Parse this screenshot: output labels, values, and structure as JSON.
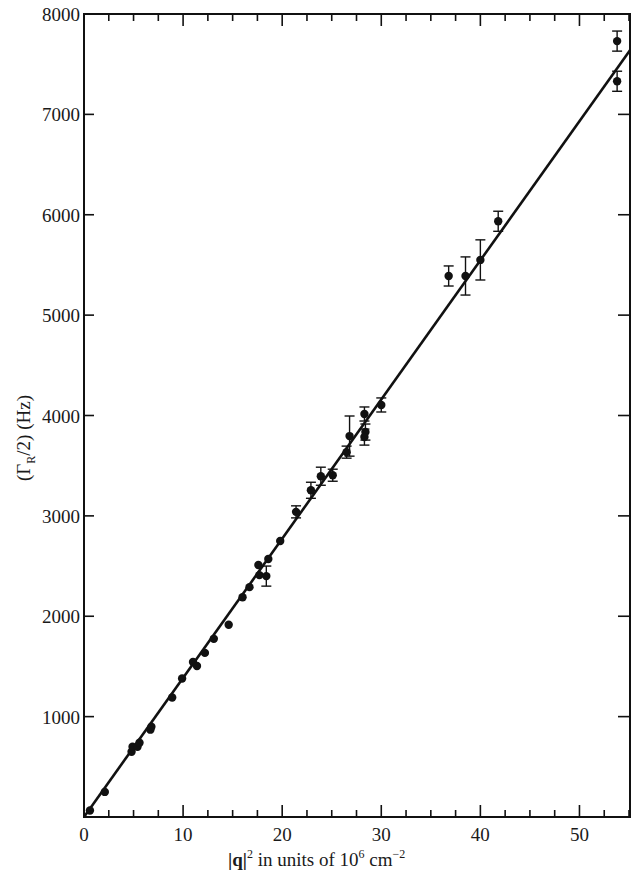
{
  "chart_data": {
    "type": "scatter",
    "title": "",
    "xlabel": "|q|² in units of 10⁶ cm⁻²",
    "xlabel_parts": {
      "q": "|q|",
      "sup1": "2",
      "mid": " in units of 10",
      "sup2": "6",
      "end": " cm",
      "sup3": "−2"
    },
    "ylabel": "(ΓR/2) (Hz)",
    "ylabel_parts": {
      "open": "(Γ",
      "sub": "R",
      "close": "/2) (Hz)"
    },
    "xlim": [
      0,
      55.1
    ],
    "ylim": [
      0,
      8000
    ],
    "x_major_ticks": [
      0,
      10,
      20,
      30,
      40,
      50
    ],
    "x_tick_labels": [
      "0",
      "10",
      "20",
      "30",
      "40",
      "50"
    ],
    "x_minor_step": 2.5,
    "y_major_ticks": [
      1000,
      2000,
      3000,
      4000,
      5000,
      6000,
      7000,
      8000
    ],
    "y_tick_labels": [
      "1000",
      "2000",
      "3000",
      "4000",
      "5000",
      "6000",
      "7000",
      "8000"
    ],
    "grid": false,
    "legend": null,
    "series": [
      {
        "name": "measurements",
        "marker": "filled-circle",
        "points": [
          {
            "x": 0.6,
            "y": 65,
            "err": 0
          },
          {
            "x": 2.1,
            "y": 250,
            "err": 0
          },
          {
            "x": 4.8,
            "y": 650,
            "err": 0
          },
          {
            "x": 4.9,
            "y": 700,
            "err": 0
          },
          {
            "x": 5.4,
            "y": 700,
            "err": 0
          },
          {
            "x": 5.6,
            "y": 740,
            "err": 0
          },
          {
            "x": 6.7,
            "y": 870,
            "err": 0
          },
          {
            "x": 6.8,
            "y": 900,
            "err": 0
          },
          {
            "x": 8.9,
            "y": 1190,
            "err": 0
          },
          {
            "x": 9.9,
            "y": 1380,
            "err": 0
          },
          {
            "x": 11.0,
            "y": 1545,
            "err": 0
          },
          {
            "x": 11.4,
            "y": 1505,
            "err": 0
          },
          {
            "x": 12.2,
            "y": 1635,
            "err": 0
          },
          {
            "x": 13.1,
            "y": 1775,
            "err": 0
          },
          {
            "x": 14.6,
            "y": 1915,
            "err": 0
          },
          {
            "x": 16.0,
            "y": 2190,
            "err": 0
          },
          {
            "x": 16.7,
            "y": 2290,
            "err": 0
          },
          {
            "x": 17.6,
            "y": 2510,
            "err": 0
          },
          {
            "x": 17.7,
            "y": 2410,
            "err": 0
          },
          {
            "x": 18.4,
            "y": 2400,
            "err": 100
          },
          {
            "x": 18.6,
            "y": 2570,
            "err": 0
          },
          {
            "x": 19.8,
            "y": 2750,
            "err": 0
          },
          {
            "x": 21.4,
            "y": 3040,
            "err": 60
          },
          {
            "x": 22.9,
            "y": 3255,
            "err": 80
          },
          {
            "x": 23.9,
            "y": 3395,
            "err": 90
          },
          {
            "x": 25.1,
            "y": 3405,
            "err": 60
          },
          {
            "x": 26.5,
            "y": 3635,
            "err": 60
          },
          {
            "x": 26.8,
            "y": 3795,
            "err": 200
          },
          {
            "x": 28.3,
            "y": 4015,
            "err": 70
          },
          {
            "x": 28.4,
            "y": 3835,
            "err": 80
          },
          {
            "x": 28.3,
            "y": 3785,
            "err": 80
          },
          {
            "x": 30.0,
            "y": 4105,
            "err": 70
          },
          {
            "x": 36.8,
            "y": 5390,
            "err": 100
          },
          {
            "x": 38.5,
            "y": 5390,
            "err": 190
          },
          {
            "x": 40.0,
            "y": 5550,
            "err": 200
          },
          {
            "x": 41.8,
            "y": 5935,
            "err": 100
          },
          {
            "x": 53.8,
            "y": 7730,
            "err": 100
          },
          {
            "x": 53.8,
            "y": 7330,
            "err": 100
          }
        ]
      }
    ],
    "fit_line": {
      "x": [
        0,
        55.1
      ],
      "y": [
        0,
        7640
      ]
    },
    "colors": {
      "ink": "#111111",
      "background": "#ffffff"
    }
  }
}
